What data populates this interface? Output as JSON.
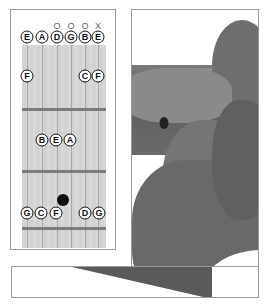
{
  "chord_chart": {
    "open_string_markers": [
      {
        "string": 3,
        "symbol": "O"
      },
      {
        "string": 4,
        "symbol": "O"
      },
      {
        "string": 5,
        "symbol": "O"
      },
      {
        "string": 6,
        "symbol": "X"
      }
    ],
    "open_string_notes": [
      "E",
      "A",
      "D",
      "G",
      "B",
      "E"
    ],
    "fret1_notes": [
      {
        "string": 1,
        "note": "F"
      },
      {
        "string": 5,
        "note": "C"
      },
      {
        "string": 6,
        "note": "F"
      }
    ],
    "fret2_notes": [
      {
        "string": 2,
        "note": "B"
      },
      {
        "string": 3,
        "note": "E"
      },
      {
        "string": 4,
        "note": "A"
      }
    ],
    "fret3_notes": [
      {
        "string": 1,
        "note": "G"
      },
      {
        "string": 2,
        "note": "C"
      },
      {
        "string": 3,
        "note": "F"
      },
      {
        "string": 5,
        "note": "D"
      },
      {
        "string": 6,
        "note": "G"
      }
    ],
    "finger_position": {
      "string": 3,
      "fret": 3,
      "color": "#0a0a0a"
    }
  },
  "photo": {
    "description": "Hand fretting guitar neck (grayscale photo)"
  },
  "colors": {
    "fretboard": "#d4d4d4",
    "fret_wire": "#7c7c7c",
    "border": "#9a9a9a"
  }
}
